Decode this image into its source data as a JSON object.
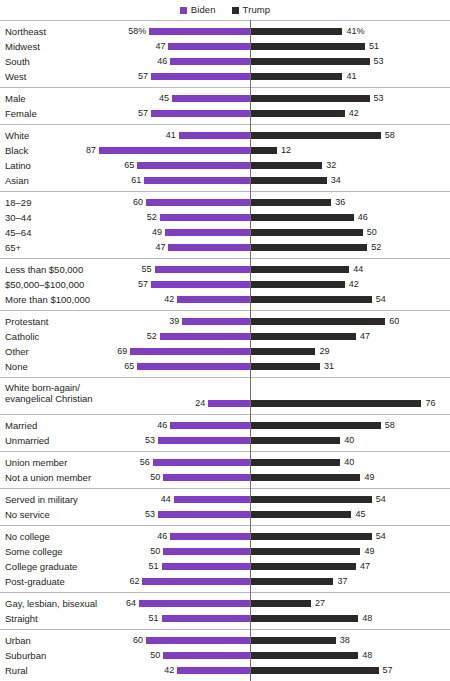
{
  "legend": {
    "entries": [
      {
        "label": "Biden",
        "color": "#7e3fc0",
        "swatch_name": "biden-swatch"
      },
      {
        "label": "Trump",
        "color": "#2b2a28",
        "swatch_name": "trump-swatch"
      }
    ]
  },
  "axis": {
    "center_value": 0
  },
  "suffix": "%",
  "chart_data": {
    "type": "bar",
    "orientation": "horizontal",
    "style": "diverging-bar",
    "title": "",
    "subtitle": "",
    "xlabel": "",
    "ylabel": "",
    "grid": false,
    "legend_position": "top-center",
    "legend": [
      "Biden",
      "Trump"
    ],
    "value_unit": "percent",
    "first_row_labels_have_percent_sign": true,
    "series": [
      {
        "name": "Biden",
        "color": "#7e3fc0",
        "direction": "left"
      },
      {
        "name": "Trump",
        "color": "#2b2a28",
        "direction": "right"
      }
    ],
    "groups": [
      {
        "name": "region",
        "rows": [
          {
            "label": "Northeast",
            "biden": 58,
            "trump": 41,
            "biden_text": "58%",
            "trump_text": "41%"
          },
          {
            "label": "Midwest",
            "biden": 47,
            "trump": 51,
            "biden_text": "47",
            "trump_text": "51"
          },
          {
            "label": "South",
            "biden": 46,
            "trump": 53,
            "biden_text": "46",
            "trump_text": "53"
          },
          {
            "label": "West",
            "biden": 57,
            "trump": 41,
            "biden_text": "57",
            "trump_text": "41"
          }
        ]
      },
      {
        "name": "gender",
        "rows": [
          {
            "label": "Male",
            "biden": 45,
            "trump": 53,
            "biden_text": "45",
            "trump_text": "53"
          },
          {
            "label": "Female",
            "biden": 57,
            "trump": 42,
            "biden_text": "57",
            "trump_text": "42"
          }
        ]
      },
      {
        "name": "race",
        "rows": [
          {
            "label": "White",
            "biden": 41,
            "trump": 58,
            "biden_text": "41",
            "trump_text": "58"
          },
          {
            "label": "Black",
            "biden": 87,
            "trump": 12,
            "biden_text": "87",
            "trump_text": "12"
          },
          {
            "label": "Latino",
            "biden": 65,
            "trump": 32,
            "biden_text": "65",
            "trump_text": "32"
          },
          {
            "label": "Asian",
            "biden": 61,
            "trump": 34,
            "biden_text": "61",
            "trump_text": "34"
          }
        ]
      },
      {
        "name": "age",
        "rows": [
          {
            "label": "18–29",
            "biden": 60,
            "trump": 36,
            "biden_text": "60",
            "trump_text": "36"
          },
          {
            "label": "30–44",
            "biden": 52,
            "trump": 46,
            "biden_text": "52",
            "trump_text": "46"
          },
          {
            "label": "45–64",
            "biden": 49,
            "trump": 50,
            "biden_text": "49",
            "trump_text": "50"
          },
          {
            "label": "65+",
            "biden": 47,
            "trump": 52,
            "biden_text": "47",
            "trump_text": "52"
          }
        ]
      },
      {
        "name": "income",
        "rows": [
          {
            "label": "Less than $50,000",
            "biden": 55,
            "trump": 44,
            "biden_text": "55",
            "trump_text": "44"
          },
          {
            "label": "$50,000–$100,000",
            "biden": 57,
            "trump": 42,
            "biden_text": "57",
            "trump_text": "42"
          },
          {
            "label": "More than $100,000",
            "biden": 42,
            "trump": 54,
            "biden_text": "42",
            "trump_text": "54"
          }
        ]
      },
      {
        "name": "religion",
        "rows": [
          {
            "label": "Protestant",
            "biden": 39,
            "trump": 60,
            "biden_text": "39",
            "trump_text": "60"
          },
          {
            "label": "Catholic",
            "biden": 52,
            "trump": 47,
            "biden_text": "52",
            "trump_text": "47"
          },
          {
            "label": "Other",
            "biden": 69,
            "trump": 29,
            "biden_text": "69",
            "trump_text": "29"
          },
          {
            "label": "None",
            "biden": 65,
            "trump": 31,
            "biden_text": "65",
            "trump_text": "31"
          }
        ]
      },
      {
        "name": "evangelical",
        "rows": [
          {
            "label": "White born-again/\nevangelical Christian",
            "biden": 24,
            "trump": 76,
            "biden_text": "24",
            "trump_text": "76",
            "tall": true
          }
        ]
      },
      {
        "name": "marital-status",
        "rows": [
          {
            "label": "Married",
            "biden": 46,
            "trump": 58,
            "biden_text": "46",
            "trump_text": "58"
          },
          {
            "label": "Unmarried",
            "biden": 53,
            "trump": 40,
            "biden_text": "53",
            "trump_text": "40"
          }
        ]
      },
      {
        "name": "union",
        "rows": [
          {
            "label": "Union member",
            "biden": 56,
            "trump": 40,
            "biden_text": "56",
            "trump_text": "40"
          },
          {
            "label": "Not a union member",
            "biden": 50,
            "trump": 49,
            "biden_text": "50",
            "trump_text": "49"
          }
        ]
      },
      {
        "name": "military",
        "rows": [
          {
            "label": "Served in military",
            "biden": 44,
            "trump": 54,
            "biden_text": "44",
            "trump_text": "54"
          },
          {
            "label": "No service",
            "biden": 53,
            "trump": 45,
            "biden_text": "53",
            "trump_text": "45"
          }
        ]
      },
      {
        "name": "education",
        "rows": [
          {
            "label": "No college",
            "biden": 46,
            "trump": 54,
            "biden_text": "46",
            "trump_text": "54"
          },
          {
            "label": "Some college",
            "biden": 50,
            "trump": 49,
            "biden_text": "50",
            "trump_text": "49"
          },
          {
            "label": "College graduate",
            "biden": 51,
            "trump": 47,
            "biden_text": "51",
            "trump_text": "47"
          },
          {
            "label": "Post-graduate",
            "biden": 62,
            "trump": 37,
            "biden_text": "62",
            "trump_text": "37"
          }
        ]
      },
      {
        "name": "sexual-orientation",
        "rows": [
          {
            "label": "Gay, lesbian, bisexual",
            "biden": 64,
            "trump": 27,
            "biden_text": "64",
            "trump_text": "27"
          },
          {
            "label": "Straight",
            "biden": 51,
            "trump": 48,
            "biden_text": "51",
            "trump_text": "48"
          }
        ]
      },
      {
        "name": "community-type",
        "rows": [
          {
            "label": "Urban",
            "biden": 60,
            "trump": 38,
            "biden_text": "60",
            "trump_text": "38"
          },
          {
            "label": "Suburban",
            "biden": 50,
            "trump": 48,
            "biden_text": "50",
            "trump_text": "48"
          },
          {
            "label": "Rural",
            "biden": 42,
            "trump": 57,
            "biden_text": "42",
            "trump_text": "57"
          }
        ]
      }
    ]
  }
}
